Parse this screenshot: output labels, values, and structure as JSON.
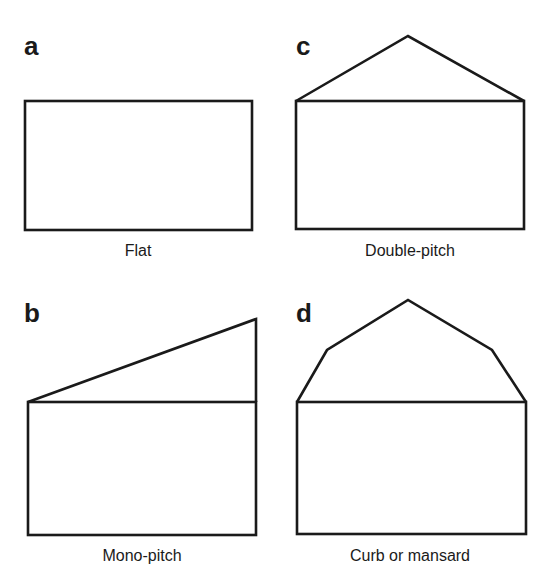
{
  "figure": {
    "panels": [
      {
        "id": "a",
        "letter": "a",
        "caption": "Flat",
        "roof_type": "flat"
      },
      {
        "id": "b",
        "letter": "b",
        "caption": "Mono-pitch",
        "roof_type": "mono-pitch"
      },
      {
        "id": "c",
        "letter": "c",
        "caption": "Double-pitch",
        "roof_type": "double-pitch"
      },
      {
        "id": "d",
        "letter": "d",
        "caption": "Curb or mansard",
        "roof_type": "curb-or-mansard"
      }
    ],
    "colors": {
      "stroke": "#1a1a1a",
      "background": "#ffffff"
    }
  }
}
